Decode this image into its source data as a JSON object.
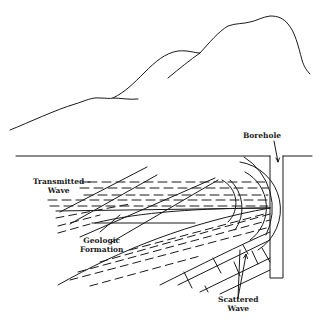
{
  "diagram": {
    "type": "geologic-cross-section",
    "colors": {
      "ink": "#1a1a1a",
      "background": "#ffffff"
    },
    "labels": {
      "borehole": "Borehole",
      "transmitted_line1": "Transmitted",
      "transmitted_line2": "Wave",
      "geologic_line1": "Geologic",
      "geologic_line2": "Formation",
      "scattered_line1": "Scattered",
      "scattered_line2": "Wave"
    },
    "elements": [
      "mountain-profile",
      "ground-surface",
      "borehole",
      "dashed-strata",
      "wavefront-arcs",
      "brick-formation"
    ]
  }
}
